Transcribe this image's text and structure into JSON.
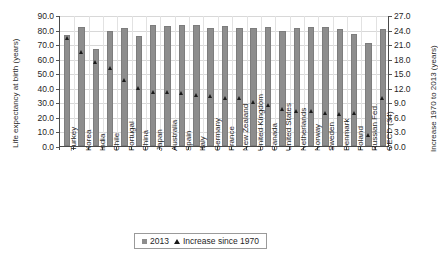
{
  "chart_data": {
    "type": "bar",
    "title": "",
    "xlabel": "",
    "ylabel": "Life expectancy at birth (years)",
    "y2label": "Increase 1970 to 2013 (years)",
    "ylim": [
      0,
      90
    ],
    "y2lim": [
      0,
      27
    ],
    "yticks": [
      "0.0",
      "10.0",
      "20.0",
      "30.0",
      "40.0",
      "50.0",
      "60.0",
      "70.0",
      "80.0",
      "90.0"
    ],
    "y2ticks": [
      "0.0",
      "3.0",
      "6.0",
      "9.0",
      "12.0",
      "15.0",
      "18.0",
      "21.0",
      "24.0",
      "27.0"
    ],
    "grid": true,
    "legend_position": "bottom",
    "categories": [
      "Turkey",
      "Korea",
      "India",
      "Chile",
      "Portugal",
      "China",
      "Japan",
      "Australia",
      "Spain",
      "Italy",
      "Germany",
      "France",
      "New Zealand",
      "United Kingdom",
      "Canada",
      "United States",
      "Netherlands",
      "Norway",
      "Sweden",
      "Denmark",
      "Poland",
      "Russian Fed.",
      "OECD (34)"
    ],
    "series": [
      {
        "name": "2013",
        "axis": "left",
        "marker": "square",
        "color": "#8d8d8d",
        "values": [
          76.0,
          81.5,
          66.4,
          78.8,
          80.9,
          75.4,
          83.4,
          82.5,
          83.2,
          82.9,
          80.9,
          82.3,
          81.4,
          81.1,
          81.5,
          78.8,
          81.4,
          81.8,
          82.0,
          80.4,
          77.1,
          70.8,
          80.5
        ]
      },
      {
        "name": "Increase since 1970",
        "axis": "right",
        "marker": "triangle",
        "color": "#1a1a1a",
        "values": [
          22.4,
          19.6,
          17.5,
          16.3,
          13.9,
          12.2,
          11.3,
          11.3,
          11.1,
          10.8,
          10.5,
          10.1,
          10.0,
          9.3,
          8.6,
          7.8,
          7.5,
          7.4,
          7.1,
          6.9,
          7.0,
          2.4,
          10.1
        ]
      }
    ]
  },
  "legend": {
    "items": [
      {
        "label": "2013",
        "marker": "square"
      },
      {
        "label": "Increase since 1970",
        "marker": "triangle"
      }
    ]
  }
}
